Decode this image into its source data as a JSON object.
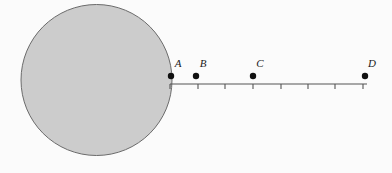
{
  "figure": {
    "background_color": "#fbfbfb",
    "stroke_color": "#555555",
    "point_color": "#111111",
    "label_color": "#1a1a1a",
    "circle": {
      "name": "shaded-circle",
      "cx": 96.5,
      "cy": 80,
      "r": 75.5,
      "fill_color": "#cccccc",
      "stroke_color": "#6b6b6b",
      "stroke_width": 1
    },
    "axis": {
      "name": "number-line",
      "y": 84,
      "x_start": 170,
      "x_end": 367,
      "stroke_width": 1.1,
      "tick_height": 5,
      "tick_positions": [
        170,
        198,
        225,
        253,
        281,
        308,
        335,
        363
      ]
    },
    "points": [
      {
        "label": "A",
        "x": 171,
        "y": 76,
        "r": 3.2,
        "label_x": 178,
        "label_y": 67
      },
      {
        "label": "B",
        "x": 196,
        "y": 76,
        "r": 3.2,
        "label_x": 203,
        "label_y": 67
      },
      {
        "label": "C",
        "x": 253,
        "y": 76,
        "r": 3.2,
        "label_x": 260,
        "label_y": 67
      },
      {
        "label": "D",
        "x": 365,
        "y": 76,
        "r": 3.2,
        "label_x": 372,
        "label_y": 67
      }
    ]
  }
}
